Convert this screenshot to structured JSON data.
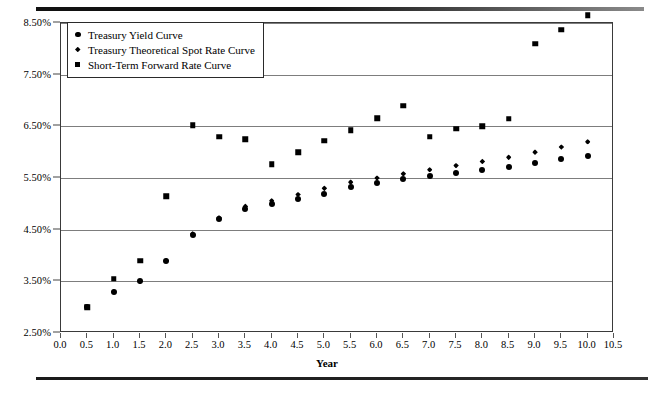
{
  "chart_data": {
    "type": "scatter",
    "title": "",
    "xlabel": "Year",
    "ylabel": "",
    "xlim": [
      0.0,
      10.5
    ],
    "ylim": [
      2.5,
      8.5
    ],
    "grid": true,
    "legend_position": "top-left",
    "x_ticks": [
      "0.0",
      "0.5",
      "1.0",
      "1.5",
      "2.0",
      "2.5",
      "3.0",
      "3.5",
      "4.0",
      "4.5",
      "5.0",
      "5.5",
      "6.0",
      "6.5",
      "7.0",
      "7.5",
      "8.0",
      "8.5",
      "9.0",
      "9.5",
      "10.0",
      "10.5"
    ],
    "y_ticks": [
      "2.50%",
      "3.50%",
      "4.50%",
      "5.50%",
      "6.50%",
      "7.50%",
      "8.50%"
    ],
    "x": [
      0.5,
      1.0,
      1.5,
      2.0,
      2.5,
      3.0,
      3.5,
      4.0,
      4.5,
      5.0,
      5.5,
      6.0,
      6.5,
      7.0,
      7.5,
      8.0,
      8.5,
      9.0,
      9.5,
      10.0
    ],
    "series": [
      {
        "name": "Treasury Yield Curve",
        "marker": "circle",
        "values": [
          3.0,
          3.3,
          3.5,
          3.9,
          4.4,
          4.7,
          4.9,
          5.0,
          5.1,
          5.2,
          5.32,
          5.4,
          5.48,
          5.54,
          5.6,
          5.66,
          5.72,
          5.8,
          5.86,
          5.92
        ]
      },
      {
        "name": "Treasury Theoretical Spot Rate Curve",
        "marker": "diamond",
        "values": [
          3.0,
          3.3,
          3.5,
          3.9,
          4.42,
          4.73,
          4.95,
          5.06,
          5.18,
          5.3,
          5.42,
          5.5,
          5.58,
          5.66,
          5.74,
          5.82,
          5.9,
          6.0,
          6.1,
          6.2
        ]
      },
      {
        "name": "Short-Term Forward Rate Curve",
        "marker": "square",
        "values": [
          3.0,
          3.55,
          3.9,
          5.15,
          6.52,
          6.3,
          6.25,
          5.77,
          6.0,
          6.22,
          6.42,
          6.66,
          6.9,
          6.3,
          6.45,
          6.5,
          6.65,
          8.1,
          8.37,
          8.65
        ]
      }
    ]
  }
}
